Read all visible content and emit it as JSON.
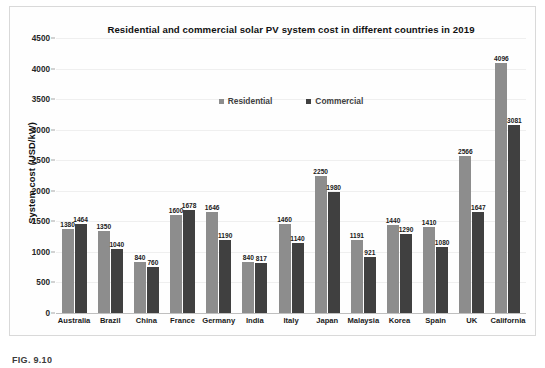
{
  "chart_data": {
    "type": "bar",
    "title": "Residential and commercial solar PV system cost in different countries in 2019",
    "xlabel": "",
    "ylabel": "System cost (USD/kW)",
    "ylim": [
      0,
      4500
    ],
    "yticks": [
      0,
      500,
      1000,
      1500,
      2000,
      2500,
      3000,
      3500,
      4000,
      4500
    ],
    "ytick_labels": [
      "0",
      "500",
      "1000",
      "1500",
      "2000",
      "2500",
      "3000",
      "3500",
      "4000",
      "4500"
    ],
    "grid": true,
    "legend_position": "top-center",
    "categories": [
      "Australia",
      "Brazil",
      "China",
      "France",
      "Germany",
      "India",
      "Italy",
      "Japan",
      "Malaysia",
      "Korea",
      "Spain",
      "UK",
      "California"
    ],
    "series": [
      {
        "name": "Residential",
        "color": "#8d8d8d",
        "values": [
          1380,
          1350,
          840,
          1600,
          1646,
          840,
          1460,
          2250,
          1191,
          1440,
          1410,
          2566,
          4096
        ]
      },
      {
        "name": "Commercial",
        "color": "#404040",
        "values": [
          1464,
          1040,
          760,
          1678,
          1190,
          817,
          1140,
          1980,
          921,
          1290,
          1080,
          1647,
          3081
        ]
      }
    ]
  },
  "figure": {
    "caption": "FIG. 9.10"
  }
}
